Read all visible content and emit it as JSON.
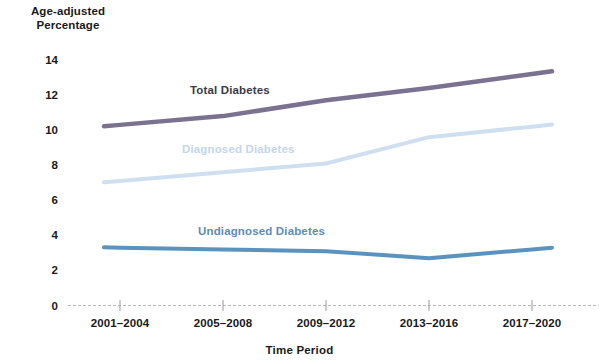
{
  "chart_data": {
    "type": "line",
    "title": "",
    "subtitle": "",
    "xlabel": "Time Period",
    "ylabel": "Age-adjusted\nPercentage",
    "categories": [
      "2001–2004",
      "2005–2008",
      "2009–2012",
      "2013–2016",
      "2017–2020"
    ],
    "ylim": [
      0,
      14
    ],
    "yticks": [
      0,
      2,
      4,
      6,
      8,
      10,
      12,
      14
    ],
    "ytick_labels": [
      "0",
      "2",
      "4",
      "6",
      "8",
      "10",
      "12",
      "14"
    ],
    "grid": false,
    "legend": "inline-labels",
    "series": [
      {
        "name": "Total Diabetes",
        "color": "#7b7190",
        "label_color": "#3b3b46",
        "values": [
          10.3,
          10.8,
          11.7,
          12.4,
          13.2
        ]
      },
      {
        "name": "Diagnosed Diabetes",
        "color": "#cfdff0",
        "label_color": "#c3d6ec",
        "values": [
          7.1,
          7.6,
          8.1,
          9.6,
          10.2
        ]
      },
      {
        "name": "Undiagnosed Diabetes",
        "color": "#5b93bf",
        "label_color": "#5b8cbb",
        "values": [
          3.3,
          3.2,
          3.1,
          2.7,
          3.2
        ]
      }
    ],
    "axis_color": "#b9b9b9"
  },
  "annotations": {
    "total_label": "Total Diabetes",
    "diagnosed_label": "Diagnosed Diabetes",
    "undiagnosed_label": "Undiagnosed Diabetes"
  }
}
